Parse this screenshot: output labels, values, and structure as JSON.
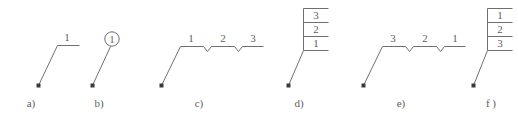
{
  "figure": {
    "background_color": "#ffffff",
    "stroke_color": "#6f6f6f",
    "dot_color": "#3a3a3a",
    "text_color": "#5e5e5e",
    "panels": [
      {
        "id": "a",
        "caption": "a)",
        "type": "bent-line-single-label",
        "labels": [
          "1"
        ],
        "circled": false
      },
      {
        "id": "b",
        "caption": "b)",
        "type": "diagonal-line-circled-label",
        "labels": [
          "1"
        ],
        "circled": true
      },
      {
        "id": "c",
        "caption": "c)",
        "type": "bent-line-notched-segments",
        "labels": [
          "1",
          "2",
          "3"
        ],
        "circled": false
      },
      {
        "id": "d",
        "caption": "d)",
        "type": "stacked-boxes",
        "labels": [
          "3",
          "2",
          "1"
        ],
        "circled": false
      },
      {
        "id": "e",
        "caption": "e)",
        "type": "bent-line-notched-segments",
        "labels": [
          "3",
          "2",
          "1"
        ],
        "circled": false
      },
      {
        "id": "f",
        "caption": "f )",
        "type": "stacked-boxes",
        "labels": [
          "1",
          "2",
          "3"
        ],
        "circled": false
      }
    ]
  }
}
